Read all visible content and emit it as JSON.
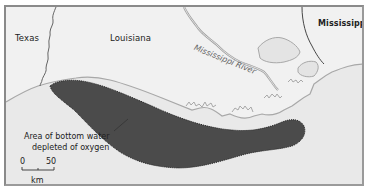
{
  "map": {
    "labels": {
      "texas": "Texas",
      "louisiana": "Louisiana",
      "mississippi": "Mississippi",
      "mississippi_river": "Mississippi River"
    },
    "legend": {
      "line1": "Area of bottom water",
      "line2": "depleted of oxygen"
    },
    "scale": {
      "start": "0",
      "end": "50",
      "unit": "km"
    },
    "colors": {
      "sea": "#e9e9e9",
      "land": "#efefef",
      "dead_zone": "#4b4b4b",
      "coastline": "#a8a8a8",
      "border": "#555555"
    }
  }
}
